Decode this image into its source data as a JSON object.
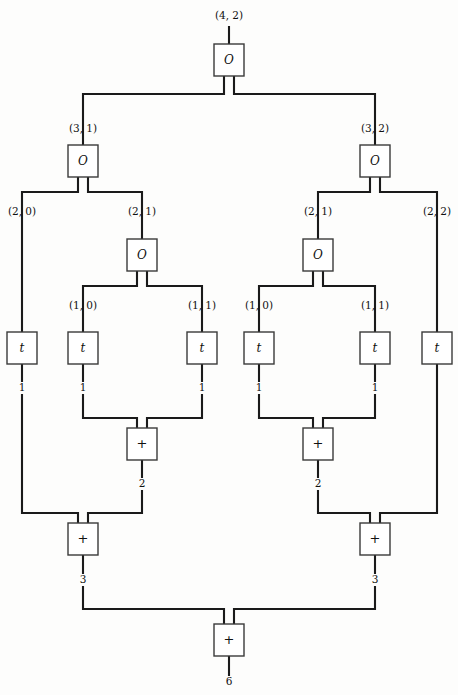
{
  "diagram": {
    "background_color": "#fdfdfc",
    "wire_color": "#1a1a1a",
    "box_fill": "#ffffff",
    "box_stroke": "#3a3a3a",
    "nodes": [
      {
        "id": "o-root",
        "label": "O",
        "kind": "O",
        "x": 229,
        "y": 60
      },
      {
        "id": "o-l",
        "label": "O",
        "kind": "O",
        "x": 83,
        "y": 161
      },
      {
        "id": "o-r",
        "label": "O",
        "kind": "O",
        "x": 375,
        "y": 161
      },
      {
        "id": "o-l2",
        "label": "O",
        "kind": "O",
        "x": 142,
        "y": 255
      },
      {
        "id": "o-r2",
        "label": "O",
        "kind": "O",
        "x": 318,
        "y": 255
      },
      {
        "id": "t-1",
        "label": "t",
        "kind": "t",
        "x": 22,
        "y": 348
      },
      {
        "id": "t-2",
        "label": "t",
        "kind": "t",
        "x": 83,
        "y": 348
      },
      {
        "id": "t-3",
        "label": "t",
        "kind": "t",
        "x": 202,
        "y": 348
      },
      {
        "id": "t-4",
        "label": "t",
        "kind": "t",
        "x": 259,
        "y": 348
      },
      {
        "id": "t-5",
        "label": "t",
        "kind": "t",
        "x": 375,
        "y": 348
      },
      {
        "id": "t-6",
        "label": "t",
        "kind": "t",
        "x": 437,
        "y": 348
      },
      {
        "id": "plus-l-in",
        "label": "+",
        "kind": "plus",
        "x": 142,
        "y": 444
      },
      {
        "id": "plus-r-in",
        "label": "+",
        "kind": "plus",
        "x": 318,
        "y": 444
      },
      {
        "id": "plus-l",
        "label": "+",
        "kind": "plus",
        "x": 83,
        "y": 539
      },
      {
        "id": "plus-r",
        "label": "+",
        "kind": "plus",
        "x": 375,
        "y": 539
      },
      {
        "id": "plus-root",
        "label": "+",
        "kind": "plus",
        "x": 229,
        "y": 640
      }
    ],
    "index_labels": [
      {
        "id": "lbl-root",
        "text": "(4, 2)",
        "x": 229,
        "y": 16
      },
      {
        "id": "lbl-l1",
        "text": "(3, 1)",
        "x": 83,
        "y": 129
      },
      {
        "id": "lbl-r1",
        "text": "(3, 2)",
        "x": 375,
        "y": 129
      },
      {
        "id": "lbl-l2-a",
        "text": "(2, 0)",
        "x": 22,
        "y": 212
      },
      {
        "id": "lbl-l2-b",
        "text": "(2, 1)",
        "x": 142,
        "y": 212
      },
      {
        "id": "lbl-r2-a",
        "text": "(2, 1)",
        "x": 318,
        "y": 212
      },
      {
        "id": "lbl-r2-b",
        "text": "(2, 2)",
        "x": 437,
        "y": 212
      },
      {
        "id": "lbl-l3-a",
        "text": "(1, 0)",
        "x": 83,
        "y": 306
      },
      {
        "id": "lbl-l3-b",
        "text": "(1, 1)",
        "x": 202,
        "y": 306
      },
      {
        "id": "lbl-r3-a",
        "text": "(1, 0)",
        "x": 259,
        "y": 306
      },
      {
        "id": "lbl-r3-b",
        "text": "(1, 1)",
        "x": 375,
        "y": 306
      }
    ],
    "value_labels": [
      {
        "id": "val-t1",
        "text": "1",
        "x": 22,
        "y": 388
      },
      {
        "id": "val-t2",
        "text": "1",
        "x": 83,
        "y": 388
      },
      {
        "id": "val-t3",
        "text": "1",
        "x": 202,
        "y": 388
      },
      {
        "id": "val-t4",
        "text": "1",
        "x": 259,
        "y": 388
      },
      {
        "id": "val-t5",
        "text": "1",
        "x": 375,
        "y": 388
      },
      {
        "id": "val-lin",
        "text": "2",
        "x": 142,
        "y": 484
      },
      {
        "id": "val-rin",
        "text": "2",
        "x": 318,
        "y": 484
      },
      {
        "id": "val-l",
        "text": "3",
        "x": 83,
        "y": 580
      },
      {
        "id": "val-r",
        "text": "3",
        "x": 375,
        "y": 580
      },
      {
        "id": "val-out",
        "text": "6",
        "x": 229,
        "y": 682
      }
    ],
    "wires": [
      {
        "id": "w-root-in",
        "d": "M 229 26 L 229 44"
      },
      {
        "id": "w-root-out-l",
        "d": "M 224 76 L 224 94 L 83 94 L 83 139"
      },
      {
        "id": "w-root-out-r",
        "d": "M 234 76 L 234 94 L 375 94 L 375 139"
      },
      {
        "id": "w-l-in",
        "d": "M 83 139 L 83 145"
      },
      {
        "id": "w-r-in",
        "d": "M 375 139 L 375 145"
      },
      {
        "id": "w-l-out-l",
        "d": "M 78 177 L 78 192 L 22 192 L 22 222"
      },
      {
        "id": "w-l-out-r",
        "d": "M 88 177 L 88 192 L 142 192 L 142 222"
      },
      {
        "id": "w-r-out-l",
        "d": "M 370 177 L 370 192 L 318 192 L 318 222"
      },
      {
        "id": "w-r-out-r",
        "d": "M 380 177 L 380 192 L 437 192 L 437 222"
      },
      {
        "id": "w-l2-in",
        "d": "M 142 222 L 142 239"
      },
      {
        "id": "w-r2-in",
        "d": "M 318 222 L 318 239"
      },
      {
        "id": "w-l2-out-l",
        "d": "M 137 271 L 137 286 L 83 286 L 83 316"
      },
      {
        "id": "w-l2-out-r",
        "d": "M 147 271 L 147 286 L 202 286 L 202 316"
      },
      {
        "id": "w-r2-out-l",
        "d": "M 313 271 L 313 286 L 259 286 L 259 316"
      },
      {
        "id": "w-r2-out-r",
        "d": "M 323 271 L 323 286 L 375 286 L 375 316"
      },
      {
        "id": "w-t1-in",
        "d": "M 22 222 L 22 332"
      },
      {
        "id": "w-t2-in",
        "d": "M 83 316 L 83 332"
      },
      {
        "id": "w-t3-in",
        "d": "M 202 316 L 202 332"
      },
      {
        "id": "w-t4-in",
        "d": "M 259 316 L 259 332"
      },
      {
        "id": "w-t5-in",
        "d": "M 375 316 L 375 332"
      },
      {
        "id": "w-t6-in",
        "d": "M 437 222 L 437 332"
      },
      {
        "id": "w-t1-out",
        "d": "M 22 364 L 22 382"
      },
      {
        "id": "w-t2-out",
        "d": "M 83 364 L 83 382"
      },
      {
        "id": "w-t3-out",
        "d": "M 202 364 L 202 382"
      },
      {
        "id": "w-t4-out",
        "d": "M 259 364 L 259 382"
      },
      {
        "id": "w-t5-out",
        "d": "M 375 364 L 375 382"
      },
      {
        "id": "w-t2-to-plus",
        "d": "M 83 394 L 83 418 L 137 418 L 137 428"
      },
      {
        "id": "w-t3-to-plus",
        "d": "M 202 394 L 202 418 L 147 418 L 147 428"
      },
      {
        "id": "w-t4-to-plus",
        "d": "M 259 394 L 259 418 L 313 418 L 313 428"
      },
      {
        "id": "w-t5-to-plus",
        "d": "M 375 394 L 375 418 L 323 418 L 323 428"
      },
      {
        "id": "w-lin-out",
        "d": "M 142 460 L 142 478"
      },
      {
        "id": "w-rin-out",
        "d": "M 318 460 L 318 478"
      },
      {
        "id": "w-t1-to-pl",
        "d": "M 22 394 L 22 513 L 78 513 L 78 523"
      },
      {
        "id": "w-lin-to-pl",
        "d": "M 142 490 L 142 513 L 88 513 L 88 523"
      },
      {
        "id": "w-t6-to-pr",
        "d": "M 437 364 L 437 513 L 380 513 L 380 523"
      },
      {
        "id": "w-rin-to-pr",
        "d": "M 318 490 L 318 513 L 370 513 L 370 523"
      },
      {
        "id": "w-pl-out",
        "d": "M 83 555 L 83 574"
      },
      {
        "id": "w-pr-out",
        "d": "M 375 555 L 375 574"
      },
      {
        "id": "w-pl-to-root",
        "d": "M 83 586 L 83 609 L 224 609 L 224 624"
      },
      {
        "id": "w-pr-to-root",
        "d": "M 375 586 L 375 609 L 234 609 L 234 624"
      },
      {
        "id": "w-root-final",
        "d": "M 229 656 L 229 676"
      }
    ]
  }
}
